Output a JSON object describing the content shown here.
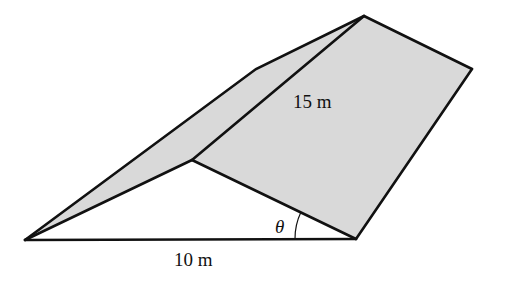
{
  "figure": {
    "labels": {
      "hypotenuse": "15 m",
      "base": "10 m",
      "angle": "θ"
    },
    "colors": {
      "fill": "#d9d9d9",
      "stroke": "#111111",
      "background": "#ffffff"
    },
    "vertices": {
      "left": [
        25,
        240
      ],
      "bottom_right": [
        356,
        239
      ],
      "middle": [
        192,
        160
      ],
      "upper_bend": [
        256,
        69
      ],
      "apex": [
        364,
        16
      ],
      "right": [
        472,
        69
      ]
    }
  }
}
